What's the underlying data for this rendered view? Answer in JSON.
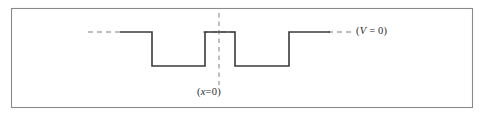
{
  "figure": {
    "name": "square-double-well-potential",
    "background_color": "#ffffff",
    "frame": {
      "stroke_color": "#8a8a8a",
      "x": 11,
      "y": 8,
      "width": 461,
      "height": 99
    },
    "labels": {
      "potential_zero": {
        "open_paren": "(",
        "symbol": "V",
        "equals": " = ",
        "value": "0",
        "close_paren": ")"
      },
      "origin": {
        "open_paren": "(",
        "symbol": "x",
        "equals": "=",
        "value": "0",
        "close_paren": ")"
      }
    }
  },
  "chart_data": {
    "type": "line",
    "title": "",
    "subtitle": "",
    "xlabel": "",
    "ylabel": "",
    "grid": false,
    "legend_position": "none",
    "curve_color": "#3a3a3a",
    "curve_stroke_width": 1.6,
    "levels": {
      "zero_level_y": 32,
      "well_bottom_y": 66
    },
    "series": [
      {
        "name": "V(x)",
        "points": [
          {
            "x": 120,
            "y": 32
          },
          {
            "x": 152,
            "y": 32
          },
          {
            "x": 152,
            "y": 66
          },
          {
            "x": 205,
            "y": 66
          },
          {
            "x": 205,
            "y": 32
          },
          {
            "x": 235,
            "y": 32
          },
          {
            "x": 235,
            "y": 66
          },
          {
            "x": 289,
            "y": 66
          },
          {
            "x": 289,
            "y": 32
          },
          {
            "x": 330,
            "y": 32
          }
        ]
      }
    ],
    "reference_lines": [
      {
        "name": "potential-zero-dashed-left",
        "orientation": "horizontal",
        "value": 32,
        "x_start": 88,
        "x_end": 122,
        "style": "dashed",
        "color": "#7d7d7d"
      },
      {
        "name": "potential-zero-dashed-middle",
        "orientation": "horizontal",
        "value": 32,
        "x_start": 203,
        "x_end": 237,
        "style": "dashed",
        "color": "#7d7d7d"
      },
      {
        "name": "potential-zero-dashed-right",
        "orientation": "horizontal",
        "value": 32,
        "x_start": 328,
        "x_end": 353,
        "style": "dashed",
        "color": "#7d7d7d"
      },
      {
        "name": "origin-axis-dashed-vertical",
        "orientation": "vertical",
        "value": 219,
        "y_start": 13,
        "y_end": 85,
        "style": "dashed",
        "color": "#8c8c8c"
      }
    ],
    "annotations": [
      {
        "name": "potential-zero-label",
        "text": "(V = 0)",
        "x": 356,
        "y": 26,
        "italic_symbol": "V"
      },
      {
        "name": "origin-label",
        "text": "(x=0)",
        "x": 197,
        "y": 87,
        "italic_symbol": "x"
      }
    ],
    "wells": [
      {
        "name": "left-well",
        "x_left": 152,
        "x_right": 205,
        "top_y": 32,
        "bottom_y": 66
      },
      {
        "name": "right-well",
        "x_left": 235,
        "x_right": 289,
        "top_y": 32,
        "bottom_y": 66
      }
    ],
    "barrier": {
      "name": "central-barrier",
      "x_left": 205,
      "x_right": 235,
      "top_y": 32
    }
  }
}
